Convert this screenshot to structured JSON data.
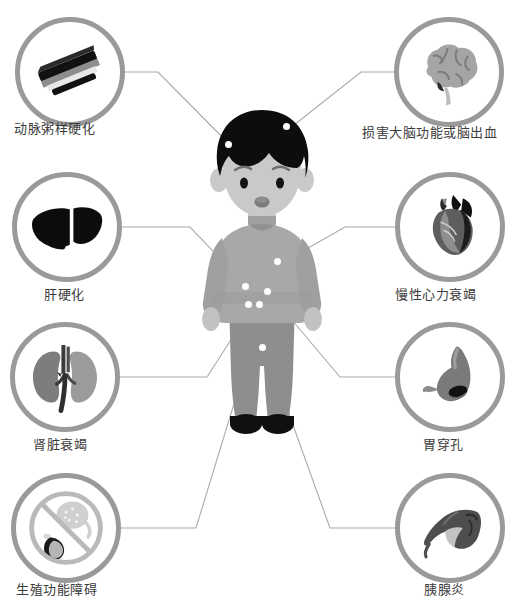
{
  "colors": {
    "ring": "#9a9a9a",
    "connector": "#aaaaaa",
    "label_text": "#3b3b3b",
    "hair": "#0d0d0d",
    "skin": "#c9c9c9",
    "shirt": "#a8a8a8",
    "pants": "#8e8e8e",
    "shoes": "#101010",
    "dot": "#ffffff",
    "background": "#ffffff"
  },
  "center_figure": {
    "name": "boy-figure",
    "description": "站立的男孩人物插图"
  },
  "nodes_left": [
    {
      "id": "atherosclerosis",
      "label": "动脉粥样硬化",
      "icon": "artery-icon",
      "circle": {
        "cx": 70,
        "cy": 72,
        "r": 55
      },
      "label_pos": {
        "x": 14,
        "y": 122
      },
      "anchor": {
        "x": 125,
        "y": 72
      },
      "elbow": {
        "x": 158,
        "y": 72
      },
      "body_point": {
        "x": 232,
        "y": 147
      }
    },
    {
      "id": "liver-cirrhosis",
      "label": "肝硬化",
      "icon": "liver-icon",
      "circle": {
        "cx": 67,
        "cy": 227,
        "r": 55
      },
      "label_pos": {
        "x": 44,
        "y": 288
      },
      "anchor": {
        "x": 122,
        "y": 227
      },
      "elbow": {
        "x": 190,
        "y": 227
      },
      "body_point": {
        "x": 249,
        "y": 289
      }
    },
    {
      "id": "kidney-failure",
      "label": "肾脏衰竭",
      "icon": "kidney-icon",
      "circle": {
        "cx": 65,
        "cy": 377,
        "r": 55
      },
      "label_pos": {
        "x": 33,
        "y": 438
      },
      "anchor": {
        "x": 120,
        "y": 377
      },
      "elbow": {
        "x": 207,
        "y": 377
      },
      "body_point": {
        "x": 252,
        "y": 307
      }
    },
    {
      "id": "reproductive-dysfunction",
      "label": "生殖功能障碍",
      "icon": "no-reproduction-icon",
      "circle": {
        "cx": 66,
        "cy": 528,
        "r": 55
      },
      "label_pos": {
        "x": 16,
        "y": 583
      },
      "anchor": {
        "x": 121,
        "y": 528
      },
      "elbow": {
        "x": 196,
        "y": 528
      },
      "body_point": {
        "x": 262,
        "y": 312
      }
    }
  ],
  "nodes_right": [
    {
      "id": "brain-damage",
      "label": "损害大脑功能或脑出血",
      "icon": "brain-icon",
      "circle": {
        "cx": 449,
        "cy": 72,
        "r": 55
      },
      "label_pos": {
        "x": 362,
        "y": 126
      },
      "anchor": {
        "x": 394,
        "y": 72
      },
      "elbow": {
        "x": 361,
        "y": 72
      },
      "body_point": {
        "x": 289,
        "y": 129
      }
    },
    {
      "id": "chronic-heart-failure",
      "label": "慢性心力衰竭",
      "icon": "heart-icon",
      "circle": {
        "cx": 450,
        "cy": 227,
        "r": 55
      },
      "label_pos": {
        "x": 395,
        "y": 288
      },
      "anchor": {
        "x": 395,
        "y": 227
      },
      "elbow": {
        "x": 345,
        "y": 227
      },
      "body_point": {
        "x": 280,
        "y": 264
      }
    },
    {
      "id": "gastric-perforation",
      "label": "胃穿孔",
      "icon": "stomach-icon",
      "circle": {
        "cx": 450,
        "cy": 377,
        "r": 55
      },
      "label_pos": {
        "x": 423,
        "y": 438
      },
      "anchor": {
        "x": 395,
        "y": 377
      },
      "elbow": {
        "x": 340,
        "y": 377
      },
      "body_point": {
        "x": 270,
        "y": 294
      }
    },
    {
      "id": "pancreatitis",
      "label": "胰腺炎",
      "icon": "pancreas-icon",
      "circle": {
        "cx": 450,
        "cy": 528,
        "r": 55
      },
      "label_pos": {
        "x": 424,
        "y": 583
      },
      "anchor": {
        "x": 395,
        "y": 528
      },
      "elbow": {
        "x": 330,
        "y": 528
      },
      "body_point": {
        "x": 266,
        "y": 350
      }
    }
  ],
  "body_dots": [
    {
      "name": "dot-head-left",
      "x": 228,
      "y": 144
    },
    {
      "name": "dot-head-right",
      "x": 286,
      "y": 126
    },
    {
      "name": "dot-chest-right",
      "x": 277,
      "y": 261
    },
    {
      "name": "dot-abdomen-left",
      "x": 245,
      "y": 286
    },
    {
      "name": "dot-abdomen-mid",
      "x": 248,
      "y": 304
    },
    {
      "name": "dot-abdomen-mid2",
      "x": 259,
      "y": 304
    },
    {
      "name": "dot-abdomen-right",
      "x": 267,
      "y": 291
    },
    {
      "name": "dot-groin",
      "x": 262,
      "y": 347
    }
  ]
}
